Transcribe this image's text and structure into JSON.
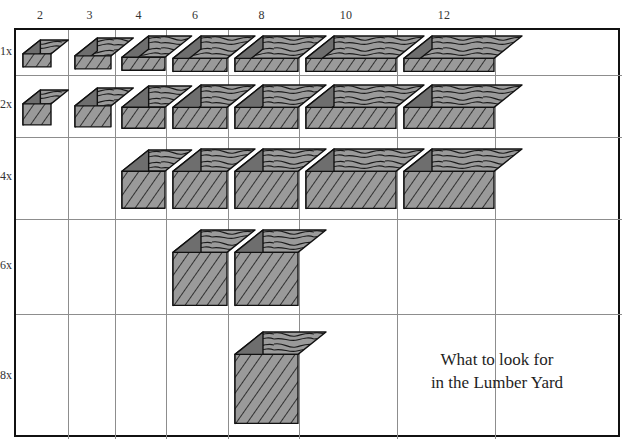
{
  "figure": {
    "caption_line1": "What to look for",
    "caption_line2": "in the Lumber Yard",
    "column_header_title": "",
    "colors": {
      "top_face": "#9a9a9a",
      "end_face": "#6e6e6e",
      "front_face": "#9a9a9a",
      "outline": "#111111",
      "grid_line": "#8d8d8d",
      "border": "#111111",
      "background": "#ffffff",
      "text": "#333333"
    }
  },
  "axes": {
    "columns": [
      {
        "label": "2",
        "nominal_width": 2
      },
      {
        "label": "3",
        "nominal_width": 3
      },
      {
        "label": "4",
        "nominal_width": 4
      },
      {
        "label": "6",
        "nominal_width": 6
      },
      {
        "label": "8",
        "nominal_width": 8
      },
      {
        "label": "10",
        "nominal_width": 10
      },
      {
        "label": "12",
        "nominal_width": 12
      }
    ],
    "rows": [
      {
        "label": "1x",
        "nominal_thickness": 1
      },
      {
        "label": "2x",
        "nominal_thickness": 2
      },
      {
        "label": "4x",
        "nominal_thickness": 4
      },
      {
        "label": "6x",
        "nominal_thickness": 6
      },
      {
        "label": "8x",
        "nominal_thickness": 8
      }
    ]
  },
  "chart_data": {
    "type": "table",
    "title": "What to look for in the Lumber Yard",
    "xlabel": "",
    "ylabel": "",
    "categories": [
      "2",
      "3",
      "4",
      "6",
      "8",
      "10",
      "12"
    ],
    "row_categories": [
      "1x",
      "2x",
      "4x",
      "6x",
      "8x"
    ],
    "legend": [],
    "grid": true,
    "cells": [
      {
        "row": "1x",
        "col": "2",
        "present": true,
        "size_label": "1x2"
      },
      {
        "row": "1x",
        "col": "3",
        "present": true,
        "size_label": "1x3"
      },
      {
        "row": "1x",
        "col": "4",
        "present": true,
        "size_label": "1x4"
      },
      {
        "row": "1x",
        "col": "6",
        "present": true,
        "size_label": "1x6"
      },
      {
        "row": "1x",
        "col": "8",
        "present": true,
        "size_label": "1x8"
      },
      {
        "row": "1x",
        "col": "10",
        "present": true,
        "size_label": "1x10"
      },
      {
        "row": "1x",
        "col": "12",
        "present": true,
        "size_label": "1x12"
      },
      {
        "row": "2x",
        "col": "2",
        "present": true,
        "size_label": "2x2"
      },
      {
        "row": "2x",
        "col": "3",
        "present": true,
        "size_label": "2x3"
      },
      {
        "row": "2x",
        "col": "4",
        "present": true,
        "size_label": "2x4"
      },
      {
        "row": "2x",
        "col": "6",
        "present": true,
        "size_label": "2x6"
      },
      {
        "row": "2x",
        "col": "8",
        "present": true,
        "size_label": "2x8"
      },
      {
        "row": "2x",
        "col": "10",
        "present": true,
        "size_label": "2x10"
      },
      {
        "row": "2x",
        "col": "12",
        "present": true,
        "size_label": "2x12"
      },
      {
        "row": "4x",
        "col": "2",
        "present": false,
        "size_label": ""
      },
      {
        "row": "4x",
        "col": "3",
        "present": false,
        "size_label": ""
      },
      {
        "row": "4x",
        "col": "4",
        "present": true,
        "size_label": "4x4"
      },
      {
        "row": "4x",
        "col": "6",
        "present": true,
        "size_label": "4x6"
      },
      {
        "row": "4x",
        "col": "8",
        "present": true,
        "size_label": "4x8"
      },
      {
        "row": "4x",
        "col": "10",
        "present": true,
        "size_label": "4x10"
      },
      {
        "row": "4x",
        "col": "12",
        "present": true,
        "size_label": "4x12"
      },
      {
        "row": "6x",
        "col": "2",
        "present": false,
        "size_label": ""
      },
      {
        "row": "6x",
        "col": "3",
        "present": false,
        "size_label": ""
      },
      {
        "row": "6x",
        "col": "4",
        "present": false,
        "size_label": ""
      },
      {
        "row": "6x",
        "col": "6",
        "present": true,
        "size_label": "6x6"
      },
      {
        "row": "6x",
        "col": "8",
        "present": true,
        "size_label": "6x8"
      },
      {
        "row": "6x",
        "col": "10",
        "present": false,
        "size_label": ""
      },
      {
        "row": "6x",
        "col": "12",
        "present": false,
        "size_label": ""
      },
      {
        "row": "8x",
        "col": "2",
        "present": false,
        "size_label": ""
      },
      {
        "row": "8x",
        "col": "3",
        "present": false,
        "size_label": ""
      },
      {
        "row": "8x",
        "col": "4",
        "present": false,
        "size_label": ""
      },
      {
        "row": "8x",
        "col": "6",
        "present": false,
        "size_label": ""
      },
      {
        "row": "8x",
        "col": "8",
        "present": true,
        "size_label": "8x8"
      },
      {
        "row": "8x",
        "col": "10",
        "present": false,
        "size_label": ""
      },
      {
        "row": "8x",
        "col": "12",
        "present": false,
        "size_label": ""
      }
    ]
  },
  "geometry": {
    "grid_left": 14,
    "grid_top": 28,
    "grid_right": 620,
    "grid_bottom": 437,
    "col_edges": [
      14,
      66,
      113,
      164,
      226,
      297,
      395,
      493,
      620
    ],
    "row_edges": [
      28,
      73,
      135,
      217,
      312,
      437
    ],
    "caption_center_x": 497,
    "caption_center_y": 372
  }
}
